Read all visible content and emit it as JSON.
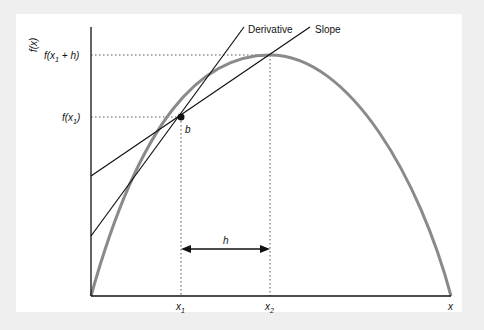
{
  "diagram": {
    "y_axis_label": "f(x)",
    "x_axis_label": "x",
    "labels": {
      "derivative": "Derivative",
      "slope": "Slope",
      "point": "b",
      "interval": "h",
      "fx1_h_prefix": "f(x",
      "fx1_h_sub": "1",
      "fx1_h_suffix": " + h)",
      "fx1_prefix": "f(x",
      "fx1_sub": "1",
      "fx1_suffix": ")",
      "x1": "x",
      "x1_sub": "1",
      "x2": "x",
      "x2_sub": "2"
    },
    "colors": {
      "curve": "#8a8a8a",
      "lines": "#111111",
      "background": "#efefef",
      "panel": "#ffffff"
    }
  }
}
